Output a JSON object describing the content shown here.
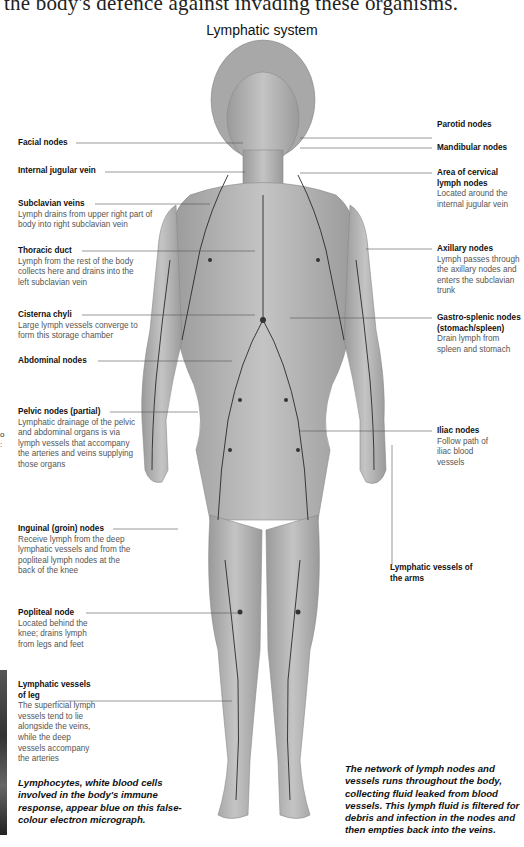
{
  "page": {
    "top_text_fragment": "the body's defence against invading these organisms.",
    "title": "Lymphatic system"
  },
  "labels_left": [
    {
      "name": "Facial nodes",
      "desc": ""
    },
    {
      "name": "Internal jugular vein",
      "desc": ""
    },
    {
      "name": "Subclavian veins",
      "desc": "Lymph drains from upper right part of body into right subclavian vein"
    },
    {
      "name": "Thoracic duct",
      "desc": "Lymph from the rest of the body collects here and drains into the left subclavian vein"
    },
    {
      "name": "Cisterna chyli",
      "desc": "Large lymph vessels converge to form this storage chamber"
    },
    {
      "name": "Abdominal nodes",
      "desc": ""
    },
    {
      "name": "Pelvic nodes (partial)",
      "desc": "Lymphatic drainage of the pelvic and abdominal organs is via lymph vessels that accompany the arteries and veins supplying those organs"
    },
    {
      "name": "Inguinal (groin) nodes",
      "desc": "Receive lymph from the deep lymphatic vessels and from the popliteal lymph nodes at the back of the knee"
    },
    {
      "name": "Popliteal node",
      "desc": "Located behind the knee; drains lymph from legs and feet"
    },
    {
      "name": "Lymphatic vessels of leg",
      "desc": "The superficial lymph vessels tend to lie alongside the veins, while the deep vessels accompany the arteries"
    }
  ],
  "labels_right": [
    {
      "name": "Parotid nodes",
      "desc": ""
    },
    {
      "name": "Mandibular nodes",
      "desc": ""
    },
    {
      "name": "Area of cervical lymph nodes",
      "desc": "Located around the internal jugular vein"
    },
    {
      "name": "Axillary nodes",
      "desc": "Lymph passes through the axillary nodes and enters the subclavian trunk"
    },
    {
      "name": "Gastro-splenic nodes (stomach/spleen)",
      "desc": "Drain lymph from spleen and stomach"
    },
    {
      "name": "Iliac nodes",
      "desc": "Follow path of iliac blood vessels"
    },
    {
      "name": "Lymphatic vessels of the arms",
      "desc": ""
    }
  ],
  "captions": {
    "left": "Lymphocytes, white blood cells involved in the body's immune response, appear blue on this false-colour electron micrograph.",
    "right": "The network of lymph nodes and vessels runs throughout the body, collecting fluid leaked from blood vessels. This lymph fluid is filtered for debris and infection in the nodes and then empties back into the veins."
  },
  "edge_fragments": [
    "o",
    ":"
  ]
}
